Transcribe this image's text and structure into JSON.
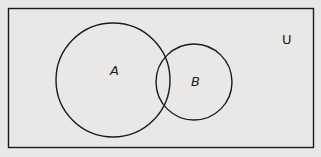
{
  "diagram": {
    "type": "venn",
    "universe_label": "U",
    "sets": [
      {
        "label": "A"
      },
      {
        "label": "B"
      }
    ],
    "colors": {
      "background": "#e9e8e6",
      "stroke": "#1a1a1a"
    }
  }
}
